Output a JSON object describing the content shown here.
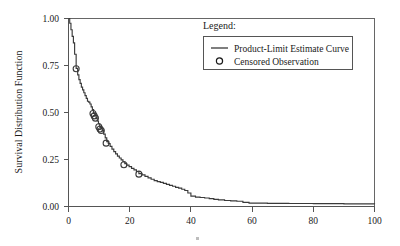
{
  "chart_data": {
    "type": "line",
    "title": "",
    "subtitle": "",
    "xlabel": "",
    "ylabel": "Survival Distribution Function",
    "xlim": [
      0,
      100
    ],
    "ylim": [
      0.0,
      1.0
    ],
    "grid": false,
    "legend_position": "top-right",
    "x_ticks": [
      0,
      20,
      40,
      60,
      80,
      100
    ],
    "x_tick_labels": [
      "0",
      "20",
      "40",
      "60",
      "80",
      "100"
    ],
    "y_ticks": [
      0.0,
      0.25,
      0.5,
      0.75,
      1.0
    ],
    "y_tick_labels": [
      "0.00",
      "0.25",
      "0.50",
      "0.75",
      "1.00"
    ],
    "series": [
      {
        "name": "Product-Limit Estimate Curve",
        "style": "step",
        "color": "#3a3a3a",
        "x": [
          0.0,
          0.4,
          0.8,
          1.2,
          1.6,
          2.0,
          2.5,
          3.0,
          3.4,
          3.8,
          4.2,
          4.6,
          5.0,
          5.4,
          5.8,
          6.2,
          6.6,
          7.0,
          7.4,
          7.8,
          8.2,
          8.6,
          9.0,
          9.4,
          9.8,
          10.2,
          10.6,
          11.0,
          11.5,
          12.0,
          12.5,
          13.0,
          13.6,
          14.2,
          14.8,
          15.4,
          16.0,
          16.6,
          17.2,
          17.8,
          18.4,
          19.0,
          19.8,
          20.6,
          21.4,
          22.2,
          23.0,
          24.0,
          25.0,
          26.0,
          27.0,
          28.0,
          29.0,
          30.0,
          31.0,
          32.0,
          33.0,
          34.0,
          35.0,
          36.0,
          37.0,
          38.0,
          39.0,
          40.0,
          41.5,
          43.0,
          44.5,
          46.0,
          47.5,
          49.0,
          51.0,
          53.0,
          55.0,
          57.0,
          59.0,
          65.0,
          72.0,
          80.0,
          90.0,
          100.0
        ],
        "y": [
          1.0,
          0.975,
          0.94,
          0.905,
          0.87,
          0.81,
          0.735,
          0.7,
          0.675,
          0.655,
          0.635,
          0.62,
          0.605,
          0.59,
          0.575,
          0.56,
          0.555,
          0.545,
          0.53,
          0.515,
          0.495,
          0.485,
          0.47,
          0.455,
          0.44,
          0.425,
          0.415,
          0.405,
          0.385,
          0.365,
          0.345,
          0.335,
          0.32,
          0.305,
          0.292,
          0.28,
          0.268,
          0.258,
          0.248,
          0.238,
          0.228,
          0.22,
          0.212,
          0.203,
          0.195,
          0.186,
          0.175,
          0.168,
          0.16,
          0.152,
          0.145,
          0.138,
          0.132,
          0.128,
          0.123,
          0.118,
          0.112,
          0.108,
          0.102,
          0.098,
          0.092,
          0.085,
          0.072,
          0.055,
          0.05,
          0.048,
          0.045,
          0.042,
          0.038,
          0.035,
          0.032,
          0.03,
          0.028,
          0.022,
          0.018,
          0.017,
          0.016,
          0.015,
          0.014,
          0.012
        ]
      }
    ],
    "censored_points": [
      {
        "x": 2.5,
        "y": 0.733
      },
      {
        "x": 8.0,
        "y": 0.495
      },
      {
        "x": 8.4,
        "y": 0.482
      },
      {
        "x": 8.8,
        "y": 0.47
      },
      {
        "x": 9.9,
        "y": 0.424
      },
      {
        "x": 10.3,
        "y": 0.412
      },
      {
        "x": 10.7,
        "y": 0.404
      },
      {
        "x": 12.3,
        "y": 0.337
      },
      {
        "x": 18.1,
        "y": 0.222
      },
      {
        "x": 23.0,
        "y": 0.172
      }
    ],
    "annotations": []
  },
  "legend": {
    "title": "Legend:",
    "entries": [
      {
        "symbol": "line",
        "label": "Product-Limit Estimate Curve"
      },
      {
        "symbol": "circle",
        "label": "Censored Observation"
      }
    ]
  },
  "icons": {
    "censored_marker": "circle-open-icon",
    "curve_sample": "line-sample-icon"
  }
}
